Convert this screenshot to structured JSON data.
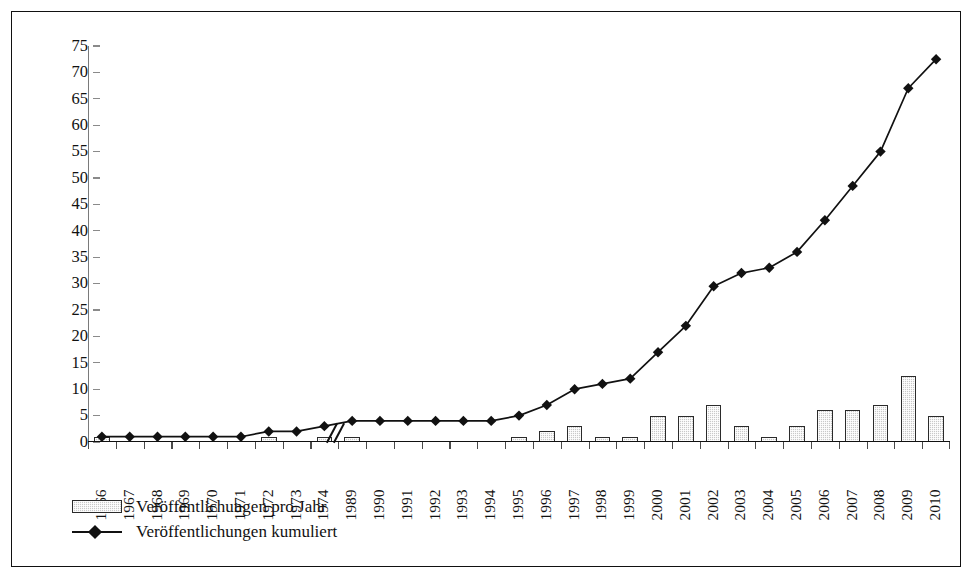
{
  "chart_data": {
    "type": "bar",
    "title": "",
    "subtitle": "",
    "xlabel": "",
    "ylabel": "",
    "ylim": [
      0,
      75
    ],
    "ytick_step": 5,
    "yticks": [
      0,
      5,
      10,
      15,
      20,
      25,
      30,
      35,
      40,
      45,
      50,
      55,
      60,
      65,
      70,
      75
    ],
    "grid": false,
    "legend_position": "bottom-left",
    "axis_break": {
      "present": true,
      "symbol": "//",
      "between": [
        "1974",
        "1989"
      ]
    },
    "categories": [
      "1966",
      "1967",
      "1968",
      "1969",
      "1970",
      "1971",
      "1972",
      "1973",
      "1974",
      "1989",
      "1990",
      "1991",
      "1992",
      "1993",
      "1994",
      "1995",
      "1996",
      "1997",
      "1998",
      "1999",
      "2000",
      "2001",
      "2002",
      "2003",
      "2004",
      "2005",
      "2006",
      "2007",
      "2008",
      "2009",
      "2010"
    ],
    "series": [
      {
        "name": "Veröffentlichungen pro Jahr",
        "type": "bar",
        "values": [
          1,
          0,
          0,
          0,
          0,
          0,
          1,
          0,
          1,
          1,
          0,
          0,
          0,
          0,
          0,
          1,
          2,
          3,
          1,
          1,
          5,
          5,
          7,
          3,
          1,
          3,
          6,
          6,
          7,
          12.5,
          5
        ]
      },
      {
        "name": "Veröffentlichungen kumuliert",
        "type": "line",
        "marker": "diamond",
        "values": [
          1,
          1,
          1,
          1,
          1,
          1,
          2,
          2,
          3,
          4,
          4,
          4,
          4,
          4,
          4,
          5,
          7,
          10,
          11,
          12,
          17,
          22,
          29.5,
          32,
          33,
          36,
          42,
          48.5,
          55,
          67,
          72.5
        ]
      }
    ],
    "colors": {
      "bar_fill": "#c9c9c9",
      "bar_border": "#2b2b2b",
      "line": "#111111",
      "marker": "#111111",
      "axis": "#111111",
      "frame": "#111111",
      "background": "#ffffff"
    }
  },
  "legend": {
    "items": [
      {
        "label": "Veröffentlichungen pro Jahr",
        "swatch": "bar"
      },
      {
        "label": "Veröffentlichungen kumuliert",
        "swatch": "line-diamond"
      }
    ]
  }
}
